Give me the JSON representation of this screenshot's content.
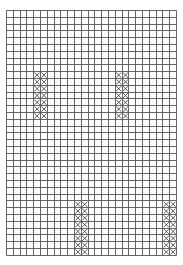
{
  "caption": "",
  "grid": {
    "cols": 25,
    "rows": 36,
    "cell": 6.8,
    "line_color": "#555555",
    "stitch_color": "#333333"
  },
  "stitch_blocks": [
    {
      "col": 4,
      "row": 9,
      "width": 2,
      "height": 7
    },
    {
      "col": 16,
      "row": 9,
      "width": 2,
      "height": 7
    },
    {
      "col": 10,
      "row": 28,
      "width": 2,
      "height": 8
    },
    {
      "col": 23,
      "row": 28,
      "width": 2,
      "height": 8
    }
  ]
}
